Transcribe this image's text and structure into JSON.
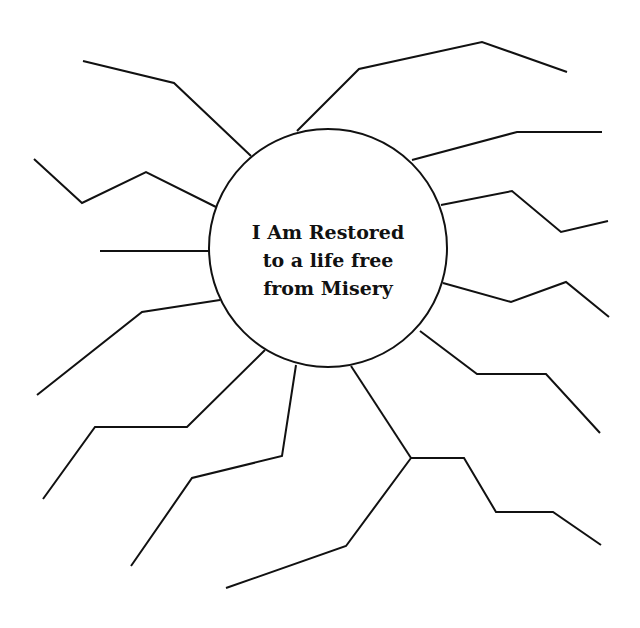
{
  "diagram": {
    "type": "mind-map / sun diagram",
    "center": {
      "lines": [
        "I Am Restored",
        "to a life free",
        "from Misery"
      ],
      "cx": 328,
      "cy": 248,
      "r": 119
    },
    "stroke_color": "#111111",
    "background": "#ffffff",
    "rays": [
      {
        "id": "ray-1",
        "points": "251,156 174,83 83,61"
      },
      {
        "id": "ray-2",
        "points": "216,207 146,172 82,203 34,159"
      },
      {
        "id": "ray-3",
        "points": "210,251 100,251"
      },
      {
        "id": "ray-4",
        "points": "297,131 359,69 482,42 567,72"
      },
      {
        "id": "ray-5",
        "points": "412,160 517,132 602,132"
      },
      {
        "id": "ray-6",
        "points": "441,205 512,191 561,232 608,221"
      },
      {
        "id": "ray-7",
        "points": "443,283 511,302 566,282 609,317"
      },
      {
        "id": "ray-8",
        "points": "420,331 477,374 546,374 600,433"
      },
      {
        "id": "ray-9-stem",
        "points": "351,366 411,458"
      },
      {
        "id": "ray-9-branch-a",
        "points": "411,458 464,458 496,512 553,512 601,545"
      },
      {
        "id": "ray-9-branch-b",
        "points": "411,458 346,546 226,588"
      },
      {
        "id": "ray-10",
        "points": "296,365 282,456 192,478 131,566"
      },
      {
        "id": "ray-11",
        "points": "265,350 187,427 95,427 43,499"
      },
      {
        "id": "ray-12",
        "points": "220,300 142,312 37,395"
      }
    ]
  }
}
